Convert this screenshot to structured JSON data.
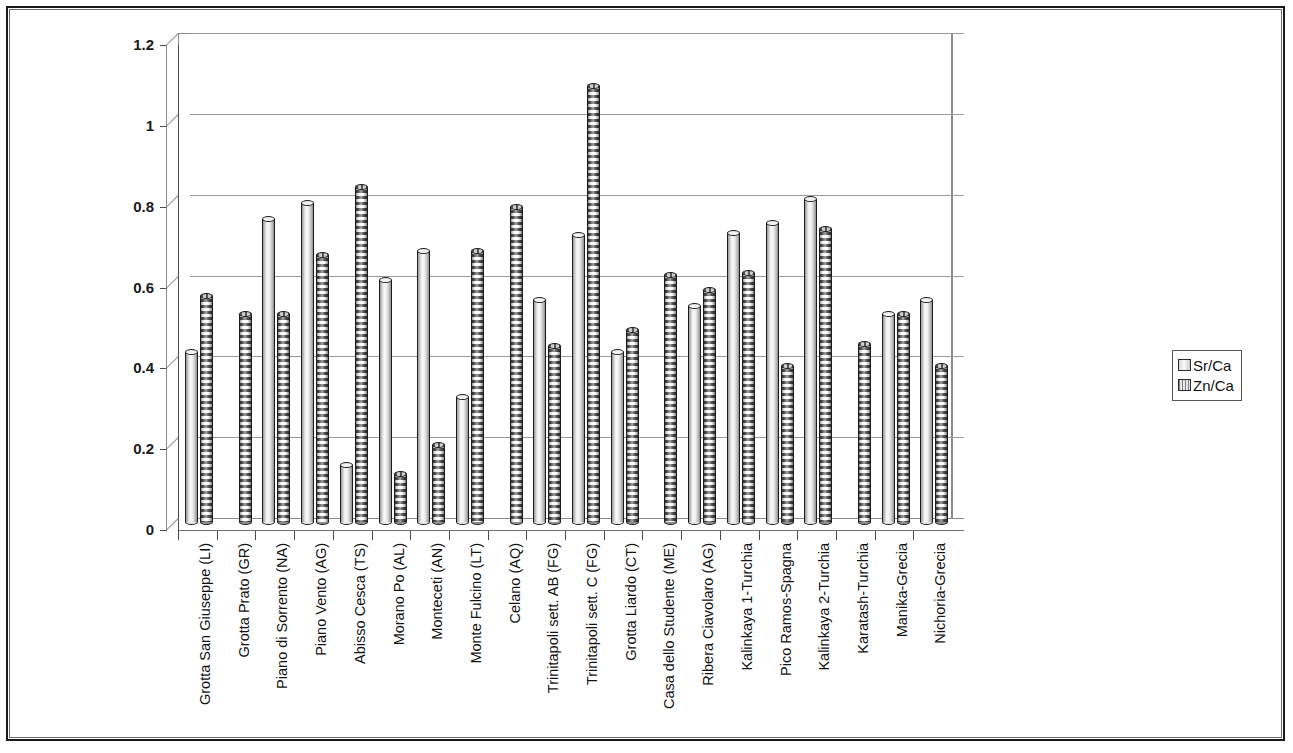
{
  "legend": {
    "position": "right",
    "entries": [
      {
        "label": "Sr/Ca",
        "key": "sr-ca-key"
      },
      {
        "label": "Zn/Ca",
        "key": "zn-ca-key"
      }
    ]
  },
  "axis": {
    "y_ticks": [
      "0",
      "0.2",
      "0.4",
      "0.6",
      "0.8",
      "1",
      "1.2"
    ]
  },
  "chart_data": {
    "type": "bar",
    "title": "",
    "subtitle": "",
    "xlabel": "",
    "ylabel": "",
    "ylim": [
      0,
      1.2
    ],
    "ytick_values": [
      0,
      0.2,
      0.4,
      0.6,
      0.8,
      1.0,
      1.2
    ],
    "grid": true,
    "style": "3D clustered cylinder",
    "legend_position": "right",
    "categories": [
      "Grotta San Giuseppe (LI)",
      "Grotta Prato (GR)",
      "Piano di Sorrento (NA)",
      "Piano Vento (AG)",
      "Abisso Cesca (TS)",
      "Morano Po (AL)",
      "Monteceti (AN)",
      "Monte Fulcino (LT)",
      "Celano (AQ)",
      "Trinitapoli sett. AB (FG)",
      "Trinitapoli sett. C (FG)",
      "Grotta Liardo (CT)",
      "Casa dello Studente (ME)",
      "Ribera Ciavolaro (AG)",
      "Kalinkaya 1-Turchia",
      "Pico Ramos-Spagna",
      "Kalinkaya 2-Turchia",
      "Karatash-Turchia",
      "Manika-Grecia",
      "Nichoria-Grecia"
    ],
    "series": [
      {
        "name": "Sr/Ca",
        "values": [
          0.42,
          null,
          0.75,
          0.79,
          0.14,
          0.6,
          0.67,
          0.31,
          null,
          0.55,
          0.71,
          0.42,
          null,
          0.535,
          0.715,
          0.74,
          0.8,
          null,
          0.515,
          0.55
        ]
      },
      {
        "name": "Zn/Ca",
        "values": [
          0.56,
          0.515,
          0.515,
          0.66,
          0.83,
          0.12,
          0.19,
          0.67,
          0.78,
          0.435,
          1.08,
          0.475,
          0.61,
          0.575,
          0.615,
          0.385,
          0.725,
          0.44,
          0.515,
          0.385
        ]
      }
    ]
  }
}
